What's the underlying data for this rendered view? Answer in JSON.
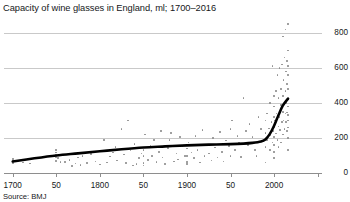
{
  "chart_data": {
    "type": "scatter",
    "title": "Capacity of wine glasses in England, ml; 1700–2016",
    "source": "Source: BMJ",
    "xlabel": "",
    "ylabel": "",
    "xlim": [
      1690,
      2055
    ],
    "ylim": [
      0,
      880
    ],
    "grid": true,
    "legend": null,
    "y_ticks": [
      0,
      200,
      400,
      600,
      800
    ],
    "y_tick_labels": [
      "0",
      "200",
      "400",
      "600",
      "800"
    ],
    "x_ticks": [
      1700,
      1750,
      1800,
      1850,
      1900,
      1950,
      2000,
      2050
    ],
    "x_tick_labels": [
      "1700",
      "50",
      "1800",
      "50",
      "1900",
      "50",
      "2000",
      ""
    ],
    "series": [
      {
        "name": "Wine glass capacity (individual glasses)",
        "type": "scatter",
        "color": "#8d8d8d",
        "points": [
          [
            1700,
            66
          ],
          [
            1700,
            72
          ],
          [
            1700,
            58
          ],
          [
            1700,
            80
          ],
          [
            1712,
            60
          ],
          [
            1720,
            55
          ],
          [
            1750,
            70
          ],
          [
            1750,
            92
          ],
          [
            1750,
            105
          ],
          [
            1750,
            118
          ],
          [
            1750,
            130
          ],
          [
            1752,
            86
          ],
          [
            1755,
            64
          ],
          [
            1758,
            100
          ],
          [
            1760,
            62
          ],
          [
            1765,
            75
          ],
          [
            1768,
            40
          ],
          [
            1772,
            55
          ],
          [
            1775,
            88
          ],
          [
            1778,
            45
          ],
          [
            1780,
            96
          ],
          [
            1785,
            58
          ],
          [
            1790,
            110
          ],
          [
            1795,
            66
          ],
          [
            1800,
            48
          ],
          [
            1805,
            190
          ],
          [
            1808,
            60
          ],
          [
            1812,
            95
          ],
          [
            1815,
            118
          ],
          [
            1818,
            150
          ],
          [
            1820,
            72
          ],
          [
            1825,
            250
          ],
          [
            1828,
            105
          ],
          [
            1830,
            56
          ],
          [
            1832,
            300
          ],
          [
            1835,
            128
          ],
          [
            1838,
            44
          ],
          [
            1840,
            165
          ],
          [
            1842,
            52
          ],
          [
            1845,
            86
          ],
          [
            1848,
            112
          ],
          [
            1850,
            130
          ],
          [
            1850,
            96
          ],
          [
            1850,
            58
          ],
          [
            1850,
            42
          ],
          [
            1852,
            220
          ],
          [
            1855,
            75
          ],
          [
            1858,
            155
          ],
          [
            1860,
            96
          ],
          [
            1862,
            188
          ],
          [
            1865,
            62
          ],
          [
            1868,
            120
          ],
          [
            1870,
            240
          ],
          [
            1872,
            88
          ],
          [
            1875,
            52
          ],
          [
            1878,
            142
          ],
          [
            1880,
            190
          ],
          [
            1882,
            230
          ],
          [
            1885,
            66
          ],
          [
            1888,
            112
          ],
          [
            1890,
            78
          ],
          [
            1892,
            205
          ],
          [
            1895,
            155
          ],
          [
            1898,
            98
          ],
          [
            1900,
            140
          ],
          [
            1900,
            96
          ],
          [
            1900,
            62
          ],
          [
            1900,
            50
          ],
          [
            1902,
            175
          ],
          [
            1905,
            118
          ],
          [
            1908,
            86
          ],
          [
            1910,
            210
          ],
          [
            1912,
            130
          ],
          [
            1915,
            60
          ],
          [
            1918,
            245
          ],
          [
            1920,
            96
          ],
          [
            1922,
            160
          ],
          [
            1925,
            112
          ],
          [
            1928,
            72
          ],
          [
            1930,
            200
          ],
          [
            1932,
            145
          ],
          [
            1935,
            88
          ],
          [
            1938,
            235
          ],
          [
            1940,
            120
          ],
          [
            1942,
            66
          ],
          [
            1945,
            185
          ],
          [
            1948,
            155
          ],
          [
            1950,
            98
          ],
          [
            1950,
            250
          ],
          [
            1952,
            300
          ],
          [
            1955,
            130
          ],
          [
            1958,
            210
          ],
          [
            1960,
            175
          ],
          [
            1962,
            92
          ],
          [
            1965,
            430
          ],
          [
            1968,
            240
          ],
          [
            1970,
            160
          ],
          [
            1972,
            280
          ],
          [
            1975,
            205
          ],
          [
            1978,
            130
          ],
          [
            1980,
            96
          ],
          [
            1982,
            320
          ],
          [
            1985,
            250
          ],
          [
            1988,
            180
          ],
          [
            1990,
            150
          ],
          [
            1990,
            230
          ],
          [
            1990,
            300
          ],
          [
            1990,
            60
          ],
          [
            1992,
            190
          ],
          [
            1992,
            340
          ],
          [
            1994,
            255
          ],
          [
            1995,
            130
          ],
          [
            1995,
            400
          ],
          [
            1996,
            215
          ],
          [
            1997,
            290
          ],
          [
            1998,
            175
          ],
          [
            1998,
            610
          ],
          [
            1999,
            240
          ],
          [
            2000,
            160
          ],
          [
            2000,
            205
          ],
          [
            2000,
            260
          ],
          [
            2000,
            320
          ],
          [
            2000,
            380
          ],
          [
            2000,
            440
          ],
          [
            2000,
            120
          ],
          [
            2000,
            85
          ],
          [
            2001,
            300
          ],
          [
            2002,
            225
          ],
          [
            2002,
            470
          ],
          [
            2003,
            340
          ],
          [
            2004,
            190
          ],
          [
            2004,
            560
          ],
          [
            2005,
            265
          ],
          [
            2005,
            430
          ],
          [
            2005,
            150
          ],
          [
            2006,
            320
          ],
          [
            2006,
            600
          ],
          [
            2007,
            245
          ],
          [
            2008,
            390
          ],
          [
            2008,
            175
          ],
          [
            2008,
            480
          ],
          [
            2009,
            290
          ],
          [
            2009,
            620
          ],
          [
            2010,
            350
          ],
          [
            2010,
            220
          ],
          [
            2010,
            440
          ],
          [
            2010,
            780
          ],
          [
            2011,
            300
          ],
          [
            2011,
            530
          ],
          [
            2012,
            395
          ],
          [
            2012,
            250
          ],
          [
            2012,
            660
          ],
          [
            2013,
            340
          ],
          [
            2013,
            470
          ],
          [
            2013,
            820
          ],
          [
            2014,
            290
          ],
          [
            2014,
            580
          ],
          [
            2014,
            400
          ],
          [
            2015,
            345
          ],
          [
            2015,
            510
          ],
          [
            2015,
            640
          ],
          [
            2015,
            240
          ],
          [
            2016,
            420
          ],
          [
            2016,
            300
          ],
          [
            2016,
            560
          ],
          [
            2016,
            700
          ],
          [
            2016,
            850
          ],
          [
            2016,
            200
          ],
          [
            2016,
            480
          ],
          [
            2016,
            380
          ],
          [
            2016,
            130
          ],
          [
            2016,
            610
          ],
          [
            2016,
            260
          ],
          [
            2016,
            330
          ]
        ]
      },
      {
        "name": "Trend",
        "type": "line",
        "color": "#000000",
        "points": [
          [
            1700,
            66
          ],
          [
            1725,
            84
          ],
          [
            1750,
            100
          ],
          [
            1775,
            112
          ],
          [
            1800,
            124
          ],
          [
            1825,
            136
          ],
          [
            1850,
            146
          ],
          [
            1875,
            152
          ],
          [
            1900,
            158
          ],
          [
            1925,
            162
          ],
          [
            1950,
            165
          ],
          [
            1965,
            168
          ],
          [
            1975,
            172
          ],
          [
            1985,
            180
          ],
          [
            1990,
            192
          ],
          [
            1995,
            222
          ],
          [
            2000,
            270
          ],
          [
            2005,
            330
          ],
          [
            2010,
            385
          ],
          [
            2016,
            425
          ]
        ]
      }
    ]
  }
}
